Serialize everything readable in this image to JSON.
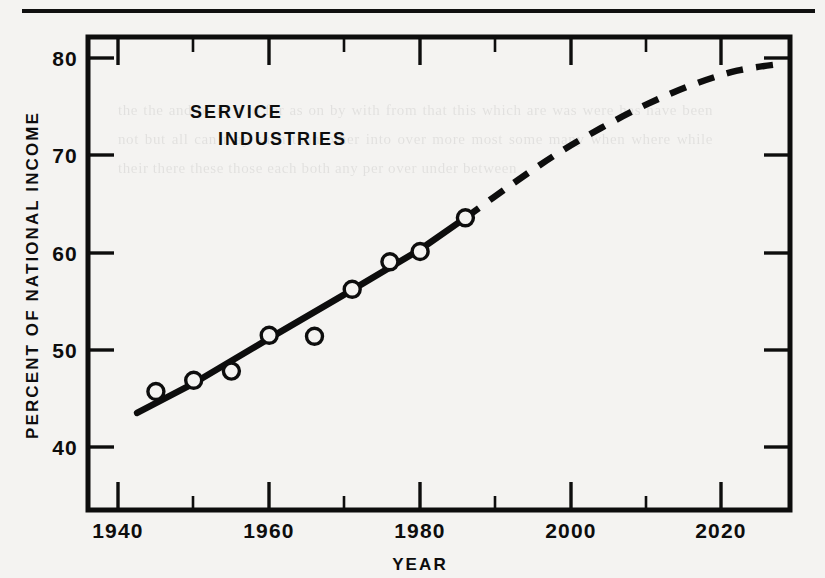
{
  "page": {
    "background_color": "#f4f3f1",
    "ink_color": "#0d0d0d",
    "top_rule": true,
    "ghost_text": "the the and of in a to for as on by with from that this which are was were has have been not but all can may such than other into over more most some many when where while their there these those each both any per over under between"
  },
  "figure": {
    "series_label_line1": "SERVICE",
    "series_label_line2": "INDUSTRIES",
    "y_axis_title": "PERCENT OF NATIONAL INCOME",
    "x_axis_title": "YEAR"
  },
  "chart_data": {
    "type": "line",
    "xlabel": "YEAR",
    "ylabel": "PERCENT OF NATIONAL INCOME",
    "xlim": [
      1936,
      2029
    ],
    "ylim": [
      36.2,
      82.5
    ],
    "grid": false,
    "legend": "none",
    "x_ticks_major": [
      1940,
      1960,
      1980,
      2000,
      2020
    ],
    "x_tick_labels": [
      "1940",
      "1960",
      "1980",
      "2000",
      "2020"
    ],
    "x_ticks_minor": [
      1950,
      1970,
      1990,
      2010
    ],
    "y_ticks_major": [
      40,
      50,
      60,
      70,
      80
    ],
    "y_tick_labels": [
      "40",
      "50",
      "60",
      "70",
      "80"
    ],
    "series": [
      {
        "name": "observed-data-points",
        "style": "open-circle-markers",
        "x": [
          1945,
          1950,
          1955,
          1960,
          1966,
          1971,
          1976,
          1980,
          1986
        ],
        "values": [
          47.8,
          48.9,
          49.8,
          53.3,
          53.2,
          57.8,
          60.5,
          61.5,
          64.8
        ]
      },
      {
        "name": "fitted-trend-solid",
        "style": "solid",
        "x": [
          1942.5,
          1950,
          1960,
          1970,
          1980,
          1986
        ],
        "values": [
          45.7,
          48.6,
          53.0,
          57.3,
          61.7,
          64.8
        ]
      },
      {
        "name": "projection-dashed",
        "style": "dashed",
        "x": [
          1986,
          1992,
          1998,
          2004,
          2010,
          2016,
          2022,
          2028
        ],
        "values": [
          64.8,
          68.0,
          71.0,
          73.6,
          75.9,
          77.8,
          79.2,
          79.9
        ]
      }
    ]
  }
}
